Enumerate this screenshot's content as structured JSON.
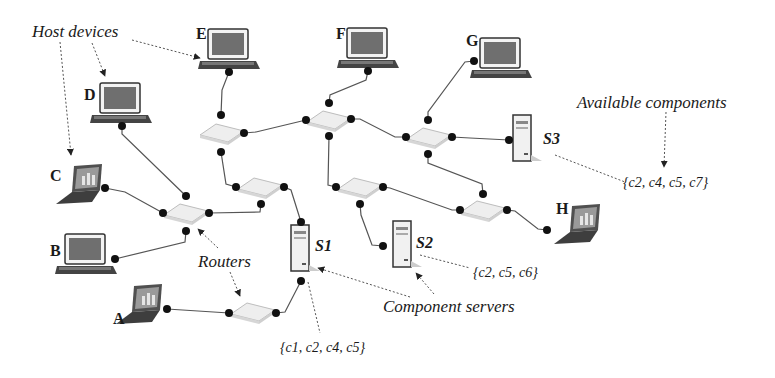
{
  "diagram": {
    "type": "network-topology",
    "annotations": {
      "host_devices": "Host devices",
      "routers": "Routers",
      "component_servers": "Component servers",
      "available_components": "Available components"
    },
    "hosts": [
      {
        "id": "A",
        "label": "A",
        "kind": "laptop"
      },
      {
        "id": "B",
        "label": "B",
        "kind": "desktop"
      },
      {
        "id": "C",
        "label": "C",
        "kind": "laptop"
      },
      {
        "id": "D",
        "label": "D",
        "kind": "desktop"
      },
      {
        "id": "E",
        "label": "E",
        "kind": "desktop"
      },
      {
        "id": "F",
        "label": "F",
        "kind": "desktop"
      },
      {
        "id": "G",
        "label": "G",
        "kind": "desktop"
      },
      {
        "id": "H",
        "label": "H",
        "kind": "laptop"
      }
    ],
    "servers": [
      {
        "id": "S1",
        "label": "S1",
        "components": "{c1, c2, c4, c5}"
      },
      {
        "id": "S2",
        "label": "S2",
        "components": "{c2, c5, c6}"
      },
      {
        "id": "S3",
        "label": "S3",
        "components": "{c2, c4, c5, c7}"
      }
    ],
    "routers": [
      "R1",
      "R2",
      "R3",
      "R4",
      "R5",
      "R6",
      "R7",
      "R8"
    ],
    "links": [
      [
        "C",
        "R1"
      ],
      [
        "B",
        "R1"
      ],
      [
        "D",
        "R1"
      ],
      [
        "R1",
        "R5"
      ],
      [
        "E",
        "R2"
      ],
      [
        "R2",
        "R3"
      ],
      [
        "R2",
        "R5"
      ],
      [
        "F",
        "R3"
      ],
      [
        "R3",
        "R4"
      ],
      [
        "R3",
        "R6"
      ],
      [
        "G",
        "R4"
      ],
      [
        "R4",
        "S3"
      ],
      [
        "R4",
        "R7"
      ],
      [
        "R5",
        "S1"
      ],
      [
        "R6",
        "S2"
      ],
      [
        "R6",
        "R7"
      ],
      [
        "R7",
        "H"
      ],
      [
        "A",
        "R8"
      ],
      [
        "R8",
        "S1"
      ]
    ]
  },
  "colors": {
    "line": "#555555",
    "dot": "#111111",
    "router_fill": "#ebebeb",
    "screen": "#6a6a6a",
    "device_body": "#3a3a3a"
  }
}
